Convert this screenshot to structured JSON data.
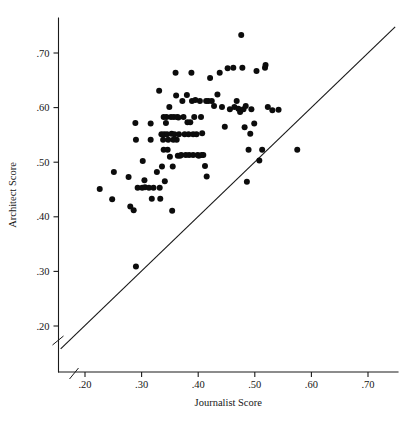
{
  "chart_data": {
    "type": "scatter",
    "title": "",
    "xlabel": "Journalist Score",
    "ylabel": "Architect Score",
    "xlim": [
      0.15,
      0.755
    ],
    "ylim": [
      0.155,
      0.755
    ],
    "xticks": [
      0.2,
      0.3,
      0.4,
      0.5,
      0.6,
      0.7
    ],
    "yticks": [
      0.2,
      0.3,
      0.4,
      0.5,
      0.6,
      0.7
    ],
    "xtick_labels": [
      ".20",
      ".30",
      ".40",
      ".50",
      ".60",
      ".70"
    ],
    "ytick_labels": [
      ".20",
      ".30",
      ".40",
      ".50",
      ".60",
      ".70"
    ],
    "grid": false,
    "legend": null,
    "axis_break": {
      "x_axis": true,
      "y_axis": true,
      "note": "diagonal slash break marks near origin on both axes"
    },
    "reference_line": {
      "kind": "identity",
      "label": "y = x",
      "x_start": 0.157,
      "y_start": 0.158,
      "x_end": 0.748,
      "y_end": 0.748,
      "color": "#1a1a1a"
    },
    "marker": {
      "shape": "circle",
      "color": "#0c0c0c",
      "size_px": 3.0
    },
    "n_points": 112,
    "points": [
      [
        0.29,
        0.309
      ],
      [
        0.226,
        0.451
      ],
      [
        0.248,
        0.432
      ],
      [
        0.251,
        0.482
      ],
      [
        0.277,
        0.473
      ],
      [
        0.28,
        0.419
      ],
      [
        0.286,
        0.412
      ],
      [
        0.289,
        0.572
      ],
      [
        0.29,
        0.541
      ],
      [
        0.293,
        0.453
      ],
      [
        0.301,
        0.453
      ],
      [
        0.302,
        0.502
      ],
      [
        0.305,
        0.467
      ],
      [
        0.306,
        0.454
      ],
      [
        0.313,
        0.453
      ],
      [
        0.316,
        0.541
      ],
      [
        0.316,
        0.571
      ],
      [
        0.318,
        0.433
      ],
      [
        0.321,
        0.453
      ],
      [
        0.327,
        0.482
      ],
      [
        0.331,
        0.631
      ],
      [
        0.332,
        0.453
      ],
      [
        0.333,
        0.433
      ],
      [
        0.336,
        0.492
      ],
      [
        0.338,
        0.541
      ],
      [
        0.339,
        0.523
      ],
      [
        0.34,
        0.551
      ],
      [
        0.341,
        0.465
      ],
      [
        0.343,
        0.572
      ],
      [
        0.344,
        0.583
      ],
      [
        0.345,
        0.551
      ],
      [
        0.347,
        0.541
      ],
      [
        0.349,
        0.601
      ],
      [
        0.35,
        0.51
      ],
      [
        0.352,
        0.583
      ],
      [
        0.353,
        0.552
      ],
      [
        0.354,
        0.411
      ],
      [
        0.355,
        0.492
      ],
      [
        0.357,
        0.583
      ],
      [
        0.358,
        0.551
      ],
      [
        0.36,
        0.664
      ],
      [
        0.361,
        0.622
      ],
      [
        0.362,
        0.541
      ],
      [
        0.363,
        0.583
      ],
      [
        0.364,
        0.512
      ],
      [
        0.366,
        0.551
      ],
      [
        0.368,
        0.512
      ],
      [
        0.37,
        0.513
      ],
      [
        0.372,
        0.612
      ],
      [
        0.374,
        0.583
      ],
      [
        0.376,
        0.551
      ],
      [
        0.378,
        0.513
      ],
      [
        0.38,
        0.623
      ],
      [
        0.381,
        0.573
      ],
      [
        0.383,
        0.551
      ],
      [
        0.384,
        0.513
      ],
      [
        0.386,
        0.573
      ],
      [
        0.388,
        0.664
      ],
      [
        0.389,
        0.612
      ],
      [
        0.391,
        0.513
      ],
      [
        0.393,
        0.583
      ],
      [
        0.395,
        0.614
      ],
      [
        0.397,
        0.551
      ],
      [
        0.399,
        0.513
      ],
      [
        0.401,
        0.512
      ],
      [
        0.403,
        0.612
      ],
      [
        0.405,
        0.583
      ],
      [
        0.407,
        0.553
      ],
      [
        0.409,
        0.513
      ],
      [
        0.412,
        0.493
      ],
      [
        0.414,
        0.612
      ],
      [
        0.415,
        0.474
      ],
      [
        0.418,
        0.612
      ],
      [
        0.421,
        0.654
      ],
      [
        0.424,
        0.612
      ],
      [
        0.428,
        0.603
      ],
      [
        0.434,
        0.624
      ],
      [
        0.438,
        0.664
      ],
      [
        0.442,
        0.601
      ],
      [
        0.447,
        0.565
      ],
      [
        0.452,
        0.672
      ],
      [
        0.456,
        0.597
      ],
      [
        0.462,
        0.673
      ],
      [
        0.464,
        0.601
      ],
      [
        0.468,
        0.612
      ],
      [
        0.471,
        0.598
      ],
      [
        0.474,
        0.592
      ],
      [
        0.476,
        0.733
      ],
      [
        0.478,
        0.673
      ],
      [
        0.48,
        0.597
      ],
      [
        0.482,
        0.564
      ],
      [
        0.484,
        0.603
      ],
      [
        0.486,
        0.464
      ],
      [
        0.489,
        0.523
      ],
      [
        0.492,
        0.552
      ],
      [
        0.494,
        0.597
      ],
      [
        0.499,
        0.571
      ],
      [
        0.503,
        0.667
      ],
      [
        0.508,
        0.503
      ],
      [
        0.513,
        0.523
      ],
      [
        0.518,
        0.673
      ],
      [
        0.519,
        0.678
      ],
      [
        0.523,
        0.601
      ],
      [
        0.531,
        0.595
      ],
      [
        0.542,
        0.596
      ],
      [
        0.575,
        0.523
      ],
      [
        0.335,
        0.551
      ],
      [
        0.339,
        0.583
      ],
      [
        0.346,
        0.523
      ],
      [
        0.356,
        0.541
      ],
      [
        0.365,
        0.582
      ],
      [
        0.391,
        0.551
      ],
      [
        0.406,
        0.513
      ]
    ]
  },
  "axis": {
    "x_title": "Journalist Score",
    "y_title": "Architect Score"
  }
}
